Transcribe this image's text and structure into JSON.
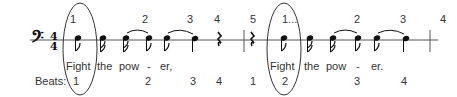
{
  "score": {
    "clef": "bass-clef",
    "time_signature": {
      "top": "4",
      "bottom": "4"
    },
    "staff_color": "#555555",
    "ink_color": "#111111"
  },
  "top_counts": [
    {
      "label": "1",
      "x": 73
    },
    {
      "label": "2",
      "x": 145
    },
    {
      "label": "3",
      "x": 190
    },
    {
      "label": "4",
      "x": 217
    },
    {
      "label": "5",
      "x": 250
    },
    {
      "label": "1...",
      "x": 285
    },
    {
      "label": "2",
      "x": 357
    },
    {
      "label": "3",
      "x": 403
    },
    {
      "label": "4",
      "x": 443
    }
  ],
  "lyrics": [
    {
      "text": "Fight",
      "x": 80
    },
    {
      "text": "the",
      "x": 106
    },
    {
      "text": "pow",
      "x": 128
    },
    {
      "text": "-",
      "x": 148
    },
    {
      "text": "er,",
      "x": 165
    },
    {
      "text": "Fight",
      "x": 283
    },
    {
      "text": "the",
      "x": 309
    },
    {
      "text": "pow",
      "x": 332
    },
    {
      "text": "-",
      "x": 356
    },
    {
      "text": "er.",
      "x": 375
    }
  ],
  "beats": {
    "label": "Beats:",
    "counts": [
      {
        "label": "1",
        "x": 80
      },
      {
        "label": "2",
        "x": 148
      },
      {
        "label": "3",
        "x": 192
      },
      {
        "label": "4",
        "x": 219
      },
      {
        "label": "1",
        "x": 252
      },
      {
        "label": "2",
        "x": 283
      },
      {
        "label": "3",
        "x": 356
      },
      {
        "label": "4",
        "x": 403
      }
    ]
  },
  "highlight_ovals": [
    {
      "name": "downbeat-oval-measure-1",
      "cx": 80,
      "cy": 49,
      "rx": 17,
      "ry": 46
    },
    {
      "name": "downbeat-oval-measure-2",
      "cx": 284,
      "cy": 49,
      "rx": 17,
      "ry": 46
    }
  ]
}
